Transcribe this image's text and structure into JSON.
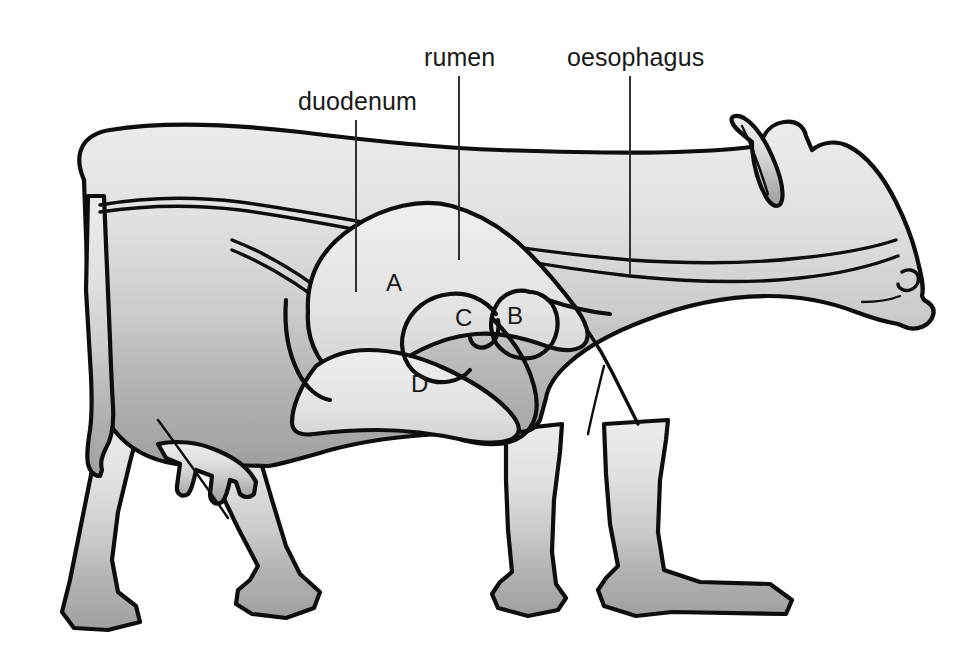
{
  "diagram": {
    "orientation": "left-facing-body-right-facing-head",
    "background_color": "#ffffff",
    "outline_color": "#0e0e0e",
    "body_fill_top_color": "#e8e8e8",
    "body_fill_bottom_color": "#a6a6a6",
    "organ_fill_color": "#e4e4e4",
    "leader_line_color": "#2a2a2a"
  },
  "labels": [
    {
      "id": "duodenum",
      "text": "duodenum",
      "text_x": 298,
      "text_y": 110,
      "line_x": 356,
      "line_y1": 120,
      "line_y2": 292
    },
    {
      "id": "rumen",
      "text": "rumen",
      "text_x": 424,
      "text_y": 66,
      "line_x": 459,
      "line_y1": 76,
      "line_y2": 260
    },
    {
      "id": "oesophagus",
      "text": "oesophagus",
      "text_x": 567,
      "text_y": 66,
      "line_x": 630,
      "line_y1": 76,
      "line_y2": 274
    }
  ],
  "compartments": [
    {
      "id": "A",
      "letter": "A",
      "x": 386,
      "y": 291,
      "name": "rumen"
    },
    {
      "id": "B",
      "letter": "B",
      "x": 507,
      "y": 324,
      "name": "reticulum"
    },
    {
      "id": "C",
      "letter": "C",
      "x": 455,
      "y": 326,
      "name": "omasum"
    },
    {
      "id": "D",
      "letter": "D",
      "x": 411,
      "y": 392,
      "name": "abomasum"
    }
  ],
  "anatomy_parts": [
    "body",
    "head",
    "ear",
    "horn-bump",
    "nostril",
    "neck",
    "tail",
    "udder",
    "front-legs",
    "hind-legs",
    "hooves",
    "oesophagus-tube",
    "stomach-compartments"
  ]
}
